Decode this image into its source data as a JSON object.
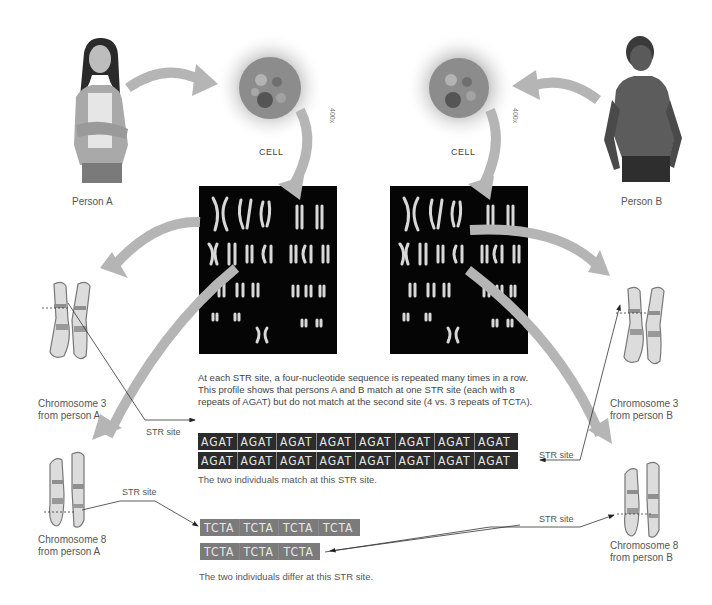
{
  "people": {
    "person_a": {
      "label": "Person A"
    },
    "person_b": {
      "label": "Person B"
    }
  },
  "cells": {
    "left": {
      "label": "CELL",
      "magnification": "400x"
    },
    "right": {
      "label": "CELL",
      "magnification": "400x"
    }
  },
  "chromosomes": {
    "a3": {
      "line1": "Chromosome 3",
      "line2": "from person A"
    },
    "a8": {
      "line1": "Chromosome 8",
      "line2": "from person A"
    },
    "b3": {
      "line1": "Chromosome 3",
      "line2": "from person B"
    },
    "b8": {
      "line1": "Chromosome 8",
      "line2": "from person B"
    }
  },
  "str_labels": {
    "a3": "STR site",
    "a8": "STR site",
    "b3": "STR site",
    "b8": "STR site"
  },
  "intro_text": {
    "line1": "At each STR site, a four-nucleotide sequence is repeated many times in a row.",
    "line2": "This profile shows that persons A and B match at one STR site (each with 8",
    "line3": "repeats of AGAT) but do not match at the second site (4 vs. 3 repeats of TCTA)."
  },
  "sequences": {
    "agat_a": [
      "AGAT",
      "AGAT",
      "AGAT",
      "AGAT",
      "AGAT",
      "AGAT",
      "AGAT",
      "AGAT"
    ],
    "agat_b": [
      "AGAT",
      "AGAT",
      "AGAT",
      "AGAT",
      "AGAT",
      "AGAT",
      "AGAT",
      "AGAT"
    ],
    "tcta_a": [
      "TCTA",
      "TCTA",
      "TCTA",
      "TCTA"
    ],
    "tcta_b": [
      "TCTA",
      "TCTA",
      "TCTA"
    ]
  },
  "captions": {
    "match": "The two individuals match at this STR site.",
    "differ": "The two individuals differ at this STR site."
  },
  "colors": {
    "arrow": "#b5b5b5",
    "seq_dark": "#2c2c2c",
    "seq_grey": "#7b7b7b",
    "karyotype_bg": "#050505"
  }
}
